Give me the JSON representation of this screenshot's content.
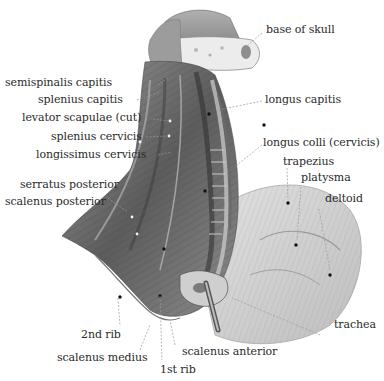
{
  "figure": {
    "colors": {
      "background": "#ffffff",
      "muscle_dark": "#4a4a4a",
      "muscle_mid": "#8a8a8a",
      "muscle_light": "#d6d6d6",
      "bone": "#e8e8e8",
      "label_text": "#2a2a2a",
      "leader_line": "#9a9a9a"
    }
  },
  "labels": {
    "base_of_skull": "base of skull",
    "semispinalis_capitis": "semispinalis capitis",
    "splenius_capitis": "splenius capitis",
    "levator_scapulae_cut": "levator scapulae (cut)",
    "splenius_cervicis": "splenius cervicis",
    "longissimus_cervicis": "longissimus cervicis",
    "serratus_posterior": "serratus posterior",
    "scalenus_posterior": "scalenus posterior",
    "longus_capitis": "longus capitis",
    "longus_colli_cervicis": "longus colli (cervicis)",
    "trapezius": "trapezius",
    "platysma": "platysma",
    "deltoid": "deltoid",
    "trachea": "trachea",
    "second_rib": "2nd rib",
    "scalenus_medius": "scalenus medius",
    "scalenus_anterior": "scalenus anterior",
    "first_rib": "1st rib"
  }
}
